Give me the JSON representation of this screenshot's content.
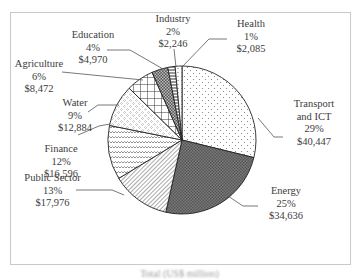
{
  "chart_data": {
    "type": "pie",
    "title": "",
    "caption": "Total (US$ million)",
    "start_angle": "12 o'clock",
    "direction": "clockwise",
    "slices": [
      {
        "label": "Transport and ICT",
        "percent": "29%",
        "value": "$40,447",
        "amount": 40447,
        "pattern": "dots"
      },
      {
        "label": "Energy",
        "percent": "25%",
        "value": "$34,636",
        "amount": 34636,
        "pattern": "dark-crosshatch"
      },
      {
        "label": "Public Sector",
        "percent": "13%",
        "value": "$17,976",
        "amount": 17976,
        "pattern": "diagonal-lines"
      },
      {
        "label": "Finance",
        "percent": "12%",
        "value": "$16,596",
        "amount": 16596,
        "pattern": "wavy-lines"
      },
      {
        "label": "Water",
        "percent": "9%",
        "value": "$12,884",
        "amount": 12884,
        "pattern": "diamond-dots"
      },
      {
        "label": "Agriculture",
        "percent": "6%",
        "value": "$8,472",
        "amount": 8472,
        "pattern": "grid"
      },
      {
        "label": "Education",
        "percent": "4%",
        "value": "$4,970",
        "amount": 4970,
        "pattern": "dark-checker"
      },
      {
        "label": "Industry",
        "percent": "2%",
        "value": "$2,246",
        "amount": 2246,
        "pattern": "horizontal-lines"
      },
      {
        "label": "Health",
        "percent": "1%",
        "value": "$2,085",
        "amount": 2085,
        "pattern": "vertical-dashes"
      }
    ],
    "legend": "none (direct labels with leader lines)"
  },
  "labels": {
    "transport": {
      "name1": "Transport",
      "name2": "and ICT",
      "pct": "29%",
      "val": "$40,447"
    },
    "energy": {
      "name": "Energy",
      "pct": "25%",
      "val": "$34,636"
    },
    "public": {
      "name": "Public Sector",
      "pct": "13%",
      "val": "$17,976"
    },
    "finance": {
      "name": "Finance",
      "pct": "12%",
      "val": "$16,596"
    },
    "water": {
      "name": "Water",
      "pct": "9%",
      "val": "$12,884"
    },
    "agriculture": {
      "name": "Agriculture",
      "pct": "6%",
      "val": "$8,472"
    },
    "education": {
      "name": "Education",
      "pct": "4%",
      "val": "$4,970"
    },
    "industry": {
      "name": "Industry",
      "pct": "2%",
      "val": "$2,246"
    },
    "health": {
      "name": "Health",
      "pct": "1%",
      "val": "$2,085"
    }
  },
  "caption": "Total (US$ million)"
}
